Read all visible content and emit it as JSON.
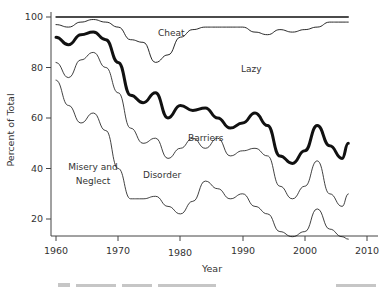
{
  "chart_data": {
    "type": "area",
    "title": "",
    "xlabel": "Year",
    "ylabel": "Percent of Total",
    "xlim": [
      1959,
      2012
    ],
    "ylim": [
      10,
      101
    ],
    "x_ticks": [
      1960,
      1970,
      1980,
      1990,
      2000,
      2010
    ],
    "y_ticks": [
      20,
      40,
      60,
      80,
      100
    ],
    "grid": false,
    "legend": "inline labels",
    "region_labels": [
      {
        "text": "Cheat",
        "x": 1978,
        "y": 97
      },
      {
        "text": "Lazy",
        "x": 1993,
        "y": 82
      },
      {
        "text": "Barriers",
        "x": 1985,
        "y": 55
      },
      {
        "text": "Disorder",
        "x": 1977,
        "y": 42
      },
      {
        "text": "Misery and",
        "x": 1965,
        "y": 38
      },
      {
        "text": "Neglect",
        "x": 1965,
        "y": 34
      }
    ],
    "x": [
      1960,
      1962,
      1964,
      1966,
      1968,
      1970,
      1972,
      1974,
      1976,
      1978,
      1980,
      1982,
      1984,
      1986,
      1988,
      1990,
      1992,
      1994,
      1996,
      1998,
      2000,
      2002,
      2004,
      2006,
      2007
    ],
    "series": [
      {
        "name": "Cheat (top boundary)",
        "values": [
          100,
          100,
          100,
          100,
          100,
          100,
          100,
          100,
          100,
          100,
          100,
          100,
          100,
          100,
          100,
          100,
          100,
          100,
          100,
          100,
          100,
          100,
          100,
          100,
          100
        ]
      },
      {
        "name": "Cheat/Lazy boundary",
        "values": [
          97,
          96,
          98,
          99,
          98,
          96,
          91,
          90,
          82,
          85,
          92,
          95,
          96,
          96,
          96,
          96,
          94,
          93,
          95,
          94,
          95,
          96,
          98,
          98,
          98
        ]
      },
      {
        "name": "Lazy/Barriers boundary (bold)",
        "values": [
          92,
          89,
          93,
          94,
          91,
          82,
          69,
          66,
          70,
          60,
          65,
          63,
          64,
          60,
          56,
          58,
          62,
          57,
          45,
          42,
          47,
          57,
          49,
          44,
          50
        ]
      },
      {
        "name": "Barriers/Disorder boundary",
        "values": [
          82,
          76,
          83,
          86,
          80,
          70,
          56,
          50,
          52,
          44,
          48,
          52,
          48,
          52,
          45,
          47,
          48,
          45,
          33,
          28,
          33,
          43,
          30,
          25,
          30
        ]
      },
      {
        "name": "Disorder/Misery and Neglect boundary",
        "values": [
          75,
          65,
          58,
          62,
          55,
          40,
          28,
          28,
          29,
          25,
          22,
          27,
          35,
          32,
          28,
          30,
          25,
          22,
          15,
          13,
          15,
          24,
          16,
          13,
          12
        ]
      }
    ]
  },
  "caption": "Figure caption (illegible, cropped)"
}
